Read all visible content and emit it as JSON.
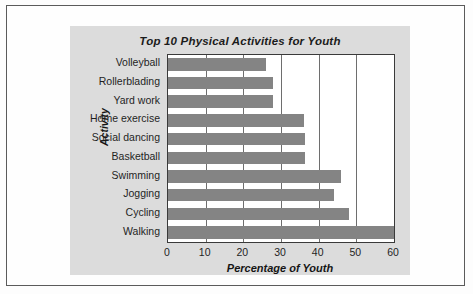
{
  "chart_data": {
    "type": "bar",
    "orientation": "horizontal",
    "title": "Top 10 Physical Activities for Youth",
    "xlabel": "Percentage of Youth",
    "ylabel": "Activity",
    "categories": [
      "Volleyball",
      "Rollerblading",
      "Yard work",
      "Home exercise",
      "Social dancing",
      "Basketball",
      "Swimming",
      "Jogging",
      "Cycling",
      "Walking"
    ],
    "values": [
      26,
      28,
      28,
      36,
      36.5,
      36.5,
      46,
      44,
      48,
      60
    ],
    "xlim": [
      0,
      60
    ],
    "xticks": [
      0,
      10,
      20,
      30,
      40,
      50,
      60
    ],
    "xtick_labels": [
      "0",
      "10",
      "20",
      "30",
      "40",
      "50",
      "60"
    ],
    "grid": "vertical",
    "legend": null,
    "colors": {
      "bar": "#848484",
      "panel": "#dcdcdc",
      "plot_background": "#ffffff",
      "gridline": "#6e6e6e",
      "axis": "#3a3a3a",
      "frame": "#5b5b5b",
      "text": "#1f1f1f"
    }
  }
}
